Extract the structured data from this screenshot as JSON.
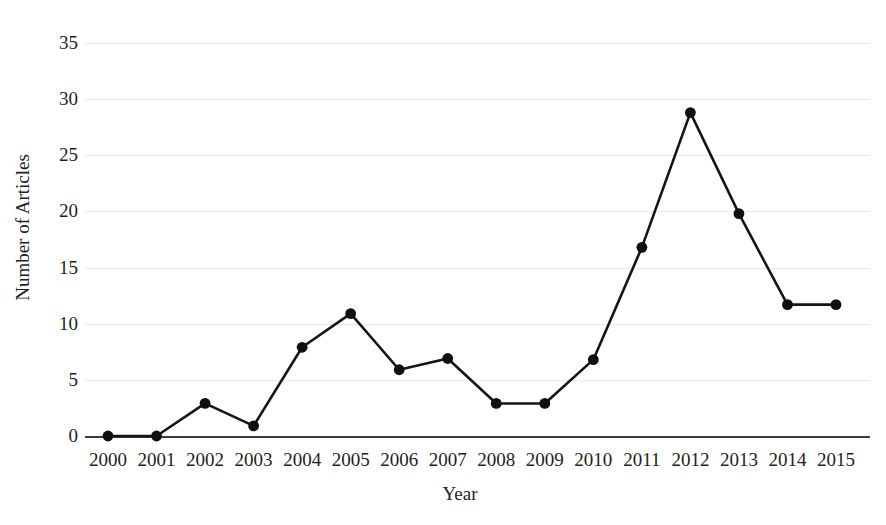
{
  "chart_data": {
    "type": "line",
    "title": "",
    "xlabel": "Year",
    "ylabel": "Number of Articles",
    "categories": [
      "2000",
      "2001",
      "2002",
      "2003",
      "2004",
      "2005",
      "2006",
      "2007",
      "2008",
      "2009",
      "2010",
      "2011",
      "2012",
      "2013",
      "2014",
      "2015"
    ],
    "x": [
      2000,
      2001,
      2002,
      2003,
      2004,
      2005,
      2006,
      2007,
      2008,
      2009,
      2010,
      2011,
      2012,
      2013,
      2014,
      2015
    ],
    "values": [
      0,
      0,
      2.9,
      0.9,
      7.9,
      10.9,
      5.9,
      6.9,
      2.9,
      2.9,
      6.8,
      16.8,
      28.8,
      19.8,
      11.7,
      11.7
    ],
    "series": [
      {
        "name": "Number of Articles",
        "values": [
          0,
          0,
          2.9,
          0.9,
          7.9,
          10.9,
          5.9,
          6.9,
          2.9,
          2.9,
          6.8,
          16.8,
          28.8,
          19.8,
          11.7,
          11.7
        ],
        "color": "#101010",
        "marker": "circle"
      }
    ],
    "ylim": [
      0,
      35
    ],
    "xlim": [
      2000,
      2015
    ],
    "yticks": [
      0,
      5,
      10,
      15,
      20,
      25,
      30,
      35
    ],
    "ytick_labels": [
      "0",
      "5",
      "10",
      "15",
      "20",
      "25",
      "30",
      "35"
    ],
    "xtick_labels": [
      "2000",
      "2001",
      "2002",
      "2003",
      "2004",
      "2005",
      "2006",
      "2007",
      "2008",
      "2009",
      "2010",
      "2011",
      "2012",
      "2013",
      "2014",
      "2015"
    ],
    "grid": true,
    "grid_axis": "y",
    "grid_color": "#ebe9ea",
    "legend": false,
    "legend_position": "none",
    "axis_line_color": "#3b3b3d",
    "background_color": "#ffffff",
    "text_color": "#231f20"
  }
}
